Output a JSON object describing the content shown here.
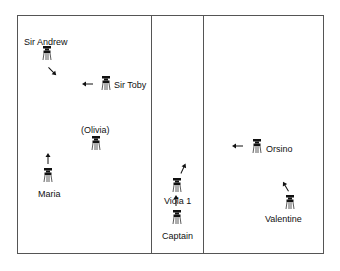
{
  "diagram": {
    "type": "stage-blocking",
    "rooms": [
      {
        "name": "left-room"
      },
      {
        "name": "middle-room"
      },
      {
        "name": "right-room"
      }
    ],
    "characters": [
      {
        "id": "sir-andrew",
        "label": "Sir Andrew",
        "fig": [
          42,
          46
        ],
        "lbl": [
          24,
          37
        ],
        "arrow": {
          "pos": [
            45,
            64
          ],
          "angle": 45
        }
      },
      {
        "id": "sir-toby",
        "label": "Sir Toby",
        "fig": [
          101,
          76
        ],
        "lbl": [
          114,
          80
        ],
        "arrow": {
          "pos": [
            81,
            77
          ],
          "angle": 180
        }
      },
      {
        "id": "olivia",
        "label": "(Olivia)",
        "fig": [
          91,
          136
        ],
        "lbl": [
          81,
          125
        ],
        "arrow": null
      },
      {
        "id": "maria",
        "label": "Maria",
        "fig": [
          43,
          168
        ],
        "lbl": [
          38,
          189
        ],
        "arrow": {
          "pos": [
            41,
            152
          ],
          "angle": -90
        }
      },
      {
        "id": "viola",
        "label": "Viola 1",
        "fig": [
          172,
          178
        ],
        "lbl": [
          164,
          196
        ],
        "arrow": {
          "pos": [
            176,
            162
          ],
          "angle": -65
        }
      },
      {
        "id": "captain",
        "label": "Captain",
        "fig": [
          172,
          210
        ],
        "lbl": [
          162,
          231
        ],
        "arrow": {
          "pos": [
            169,
            194
          ],
          "angle": -90
        }
      },
      {
        "id": "orsino",
        "label": "Orsino",
        "fig": [
          252,
          139
        ],
        "lbl": [
          266,
          144
        ],
        "arrow": {
          "pos": [
            231,
            139
          ],
          "angle": 180
        }
      },
      {
        "id": "valentine",
        "label": "Valentine",
        "fig": [
          285,
          195
        ],
        "lbl": [
          265,
          214
        ],
        "arrow": {
          "pos": [
            279,
            180
          ],
          "angle": -120
        }
      }
    ]
  }
}
